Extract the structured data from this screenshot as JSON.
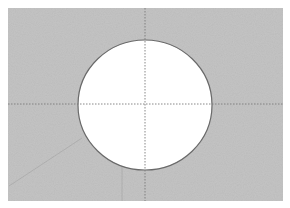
{
  "image": {
    "description": "Grayscale photo-like figure: textured gray rectangle with a white circular disc in the center, crossed by dotted horizontal and vertical centerlines",
    "colors": {
      "background": "#ffffff",
      "field": "#c4c4c4",
      "disc": "#ffffff",
      "disc_outline": "#6a6a6a",
      "crosshair": "#7a7a7a",
      "faint_line": "#9a9a9a"
    }
  }
}
